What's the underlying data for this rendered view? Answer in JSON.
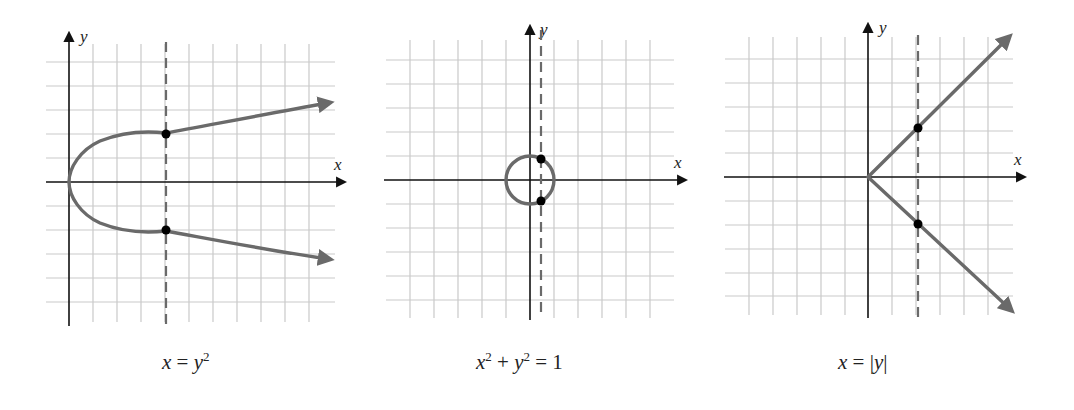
{
  "figure": {
    "panels": [
      {
        "id": "parabola",
        "caption": {
          "lhs": "x",
          "op": " = ",
          "rhs_var": "y",
          "rhs_exp": "2"
        },
        "axis_labels": {
          "x": "x",
          "y": "y"
        },
        "grid": {
          "x_range": [
            -1,
            11
          ],
          "y_range": [
            -6,
            6
          ],
          "unit_px": 24
        },
        "curve": "x = y^2",
        "test_line_x": 4,
        "points": [
          {
            "x": 4,
            "y": 2
          },
          {
            "x": 4,
            "y": -2
          }
        ]
      },
      {
        "id": "circle",
        "caption": {
          "a_var": "x",
          "a_exp": "2",
          "plus": " + ",
          "b_var": "y",
          "b_exp": "2",
          "eq": " = 1"
        },
        "axis_labels": {
          "x": "x",
          "y": "y"
        },
        "grid": {
          "x_range": [
            -6,
            6
          ],
          "y_range": [
            -6,
            6
          ],
          "unit_px": 24
        },
        "curve": "x^2 + y^2 = 1",
        "test_line_x": 0.5,
        "points": [
          {
            "x": 0.5,
            "y": 0.87
          },
          {
            "x": 0.5,
            "y": -0.87
          }
        ]
      },
      {
        "id": "absolute",
        "caption": {
          "lhs": "x",
          "op": " = ",
          "bar_l": "|",
          "var": "y",
          "bar_r": "|"
        },
        "axis_labels": {
          "x": "x",
          "y": "y"
        },
        "grid": {
          "x_range": [
            -6,
            6
          ],
          "y_range": [
            -6,
            6
          ],
          "unit_px": 24
        },
        "curve": "x = |y|",
        "test_line_x": 2,
        "points": [
          {
            "x": 2,
            "y": 2
          },
          {
            "x": 2,
            "y": -2
          }
        ]
      }
    ],
    "colors": {
      "curve": "#6a6a6a",
      "grid": "#c9c9c9",
      "axis": "#111111",
      "point": "#000000"
    }
  }
}
